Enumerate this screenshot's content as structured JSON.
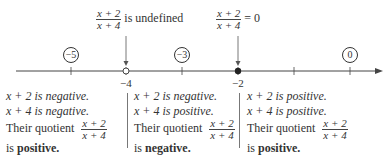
{
  "annotations": {
    "undefined": {
      "numerator": "x + 2",
      "denominator": "x + 4",
      "text": "is undefined"
    },
    "zero": {
      "numerator": "x + 2",
      "denominator": "x + 4",
      "text": "= 0"
    }
  },
  "number_line": {
    "ticks": [
      -5,
      -4,
      -3,
      -2,
      -1,
      0
    ],
    "labeled_ticks": {
      "minus4": "−4",
      "minus2": "−2"
    },
    "test_points": {
      "p1": "−5",
      "p2": "−3",
      "p3": "0"
    },
    "open_point": -4,
    "closed_point": -2
  },
  "regions": [
    {
      "line1": "x + 2 is negative.",
      "line2": "x + 4 is negative.",
      "quotient_label": "Their quotient",
      "numerator": "x + 2",
      "denominator": "x + 4",
      "is": "is",
      "sign": "positive."
    },
    {
      "line1": "x + 2 is negative.",
      "line2": "x + 4 is positive.",
      "quotient_label": "Their quotient",
      "numerator": "x + 2",
      "denominator": "x + 4",
      "is": "is",
      "sign": "negative."
    },
    {
      "line1": "x + 2 is positive.",
      "line2": "x + 4 is positive.",
      "quotient_label": "Their quotient",
      "numerator": "x + 2",
      "denominator": "x + 4",
      "is": "is",
      "sign": "positive."
    }
  ]
}
